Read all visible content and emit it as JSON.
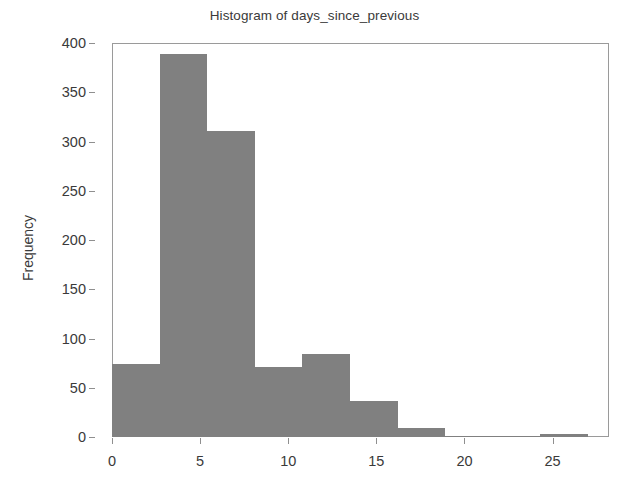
{
  "chart_data": {
    "type": "bar",
    "subtype": "histogram",
    "title": "Histogram of days_since_previous",
    "xlabel": "",
    "ylabel": "Frequency",
    "xlim": [
      0,
      28.2
    ],
    "ylim": [
      0,
      400
    ],
    "grid": false,
    "legend": null,
    "bar_color": "#808080",
    "bin_edges": [
      0,
      2.7,
      5.4,
      8.1,
      10.8,
      13.5,
      16.2,
      18.9,
      21.6,
      24.3,
      27.0
    ],
    "bin_width": 2.7,
    "categories": [
      "0-2.7",
      "2.7-5.4",
      "5.4-8.1",
      "8.1-10.8",
      "10.8-13.5",
      "13.5-16.2",
      "16.2-18.9",
      "18.9-21.6",
      "21.6-24.3",
      "24.3-27"
    ],
    "values": [
      74,
      389,
      311,
      71,
      84,
      37,
      9,
      1,
      1,
      3
    ],
    "xticks": [
      0,
      5,
      10,
      15,
      20,
      25
    ],
    "xtick_labels": [
      "0",
      "5",
      "10",
      "15",
      "20",
      "25"
    ],
    "yticks": [
      0,
      50,
      100,
      150,
      200,
      250,
      300,
      350,
      400
    ],
    "ytick_labels": [
      "0",
      "50",
      "100",
      "150",
      "200",
      "250",
      "300",
      "350",
      "400"
    ]
  }
}
